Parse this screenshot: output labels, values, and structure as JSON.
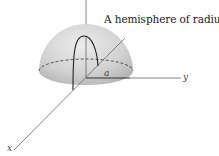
{
  "caption": {
    "text": "A hemisphere of radius ",
    "variable": "a"
  },
  "axes": {
    "x_label": "x",
    "y_label": "y",
    "z_label": ""
  },
  "radius_label": "a",
  "colors": {
    "hemisphere_fill_light": "#e6e6e6",
    "hemisphere_fill_dark": "#b8b8b8",
    "axis": "#666666",
    "outline": "#222222"
  }
}
